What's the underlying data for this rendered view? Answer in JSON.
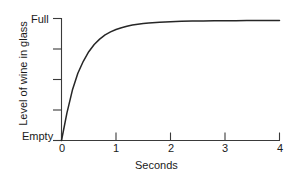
{
  "chart_data": {
    "type": "line",
    "title": "",
    "subtitle": "",
    "xlabel": "Seconds",
    "ylabel": "Level of wine in glass",
    "xlim": [
      0,
      4
    ],
    "ylim": [
      0,
      1
    ],
    "grid": false,
    "legend": null,
    "legend_position": "none",
    "xticks": [
      0,
      1,
      2,
      3,
      4
    ],
    "xticklabels": [
      "0",
      "1",
      "2",
      "3",
      "4"
    ],
    "yticks": [
      0,
      0.25,
      0.5,
      0.75,
      1
    ],
    "yticklabels": [
      "Empty",
      "",
      "",
      "",
      "Full"
    ],
    "y_axis_min_label": "Empty",
    "y_axis_max_label": "Full",
    "series": [
      {
        "name": "wine level",
        "x": [
          0.0,
          0.1,
          0.2,
          0.3,
          0.4,
          0.5,
          0.6,
          0.7,
          0.8,
          0.9,
          1.0,
          1.1,
          1.2,
          1.3,
          1.4,
          1.5,
          1.6,
          1.8,
          2.0,
          2.2,
          2.4,
          2.6,
          2.8,
          3.0,
          3.2,
          3.4,
          3.6,
          3.8,
          4.0
        ],
        "y": [
          0.0,
          0.23,
          0.42,
          0.56,
          0.66,
          0.74,
          0.8,
          0.845,
          0.88,
          0.905,
          0.925,
          0.94,
          0.952,
          0.962,
          0.969,
          0.975,
          0.98,
          0.986,
          0.99,
          0.993,
          0.995,
          0.996,
          0.997,
          0.998,
          0.998,
          0.999,
          0.999,
          0.999,
          1.0
        ]
      }
    ],
    "annotations": []
  },
  "axes": {
    "x_tick_labels": [
      "0",
      "1",
      "2",
      "3",
      "4"
    ],
    "y_top_label": "Full",
    "y_bottom_label": "Empty",
    "x_axis_title": "Seconds",
    "y_axis_title": "Level of wine in glass"
  },
  "colors": {
    "background": "#ffffff",
    "axis": "#3a3a3a",
    "curve": "#262626",
    "text": "#1a1a1a"
  }
}
